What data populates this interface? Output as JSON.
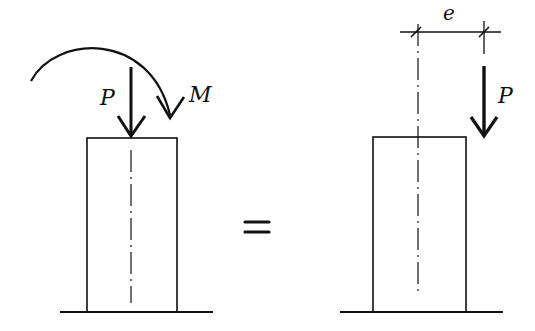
{
  "diagram": {
    "left": {
      "force_label": "P",
      "moment_label": "M"
    },
    "equals_symbol": "=",
    "right": {
      "force_label": "P",
      "eccentricity_label": "e"
    },
    "colors": {
      "stroke": "#111111",
      "background": "#ffffff"
    }
  }
}
